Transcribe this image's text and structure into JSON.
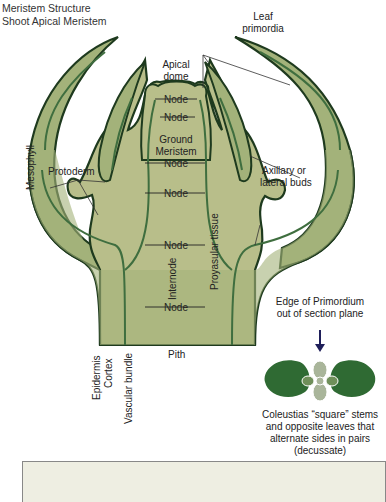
{
  "title": {
    "line1": "Meristem Structure",
    "line2": "Shoot Apical Meristem"
  },
  "labels": {
    "leaf_primordia_1": "Leaf",
    "leaf_primordia_2": "primordia",
    "apical_dome_1": "Apical",
    "apical_dome_2": "dome",
    "node": "Node",
    "ground_meristem_1": "Ground",
    "ground_meristem_2": "Meristem",
    "protoderm": "Protoderm",
    "axillary_1": "Axillary or",
    "axillary_2": "lateral buds",
    "mesophyll": "Mesophyll",
    "provascular": "Proyasular tissue",
    "internode": "Internode",
    "epidermis": "Epidermis",
    "cortex": "Cortex",
    "vascular_bundle": "Vascular bundle",
    "pith": "Pith",
    "edge_1": "Edge of Primordium",
    "edge_2": "out of section plane",
    "caption_1": "Coleustias “square” stems",
    "caption_2": "and opposite leaves that",
    "caption_3": "alternate sides in pairs",
    "caption_4": "(decussate)"
  },
  "colors": {
    "tissue": "#b8be8a",
    "leaf": "#a3b27a",
    "outline": "#1e3a1e",
    "vascular": "#3f6e3f",
    "dark_leaf": "#2f6a33",
    "light_leaf": "#a9b59a",
    "arrow": "#1f1f5a",
    "panel": "#eeeee2"
  }
}
